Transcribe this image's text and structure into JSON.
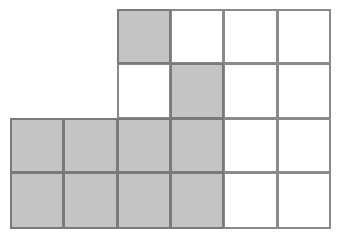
{
  "diagram": {
    "type": "grid-shading",
    "columns": 6,
    "rows": 4,
    "col_lines": [
      10,
      63,
      117,
      170,
      223,
      277,
      330
    ],
    "row_lines": [
      9,
      63,
      118,
      172,
      228
    ],
    "colors": {
      "shaded": "#c4c4c4",
      "unshaded": "#ffffff",
      "line": "#8a8a8a"
    },
    "cells": [
      [
        null,
        null,
        "gray",
        "white",
        "white",
        "white"
      ],
      [
        null,
        null,
        "white",
        "gray",
        "white",
        "white"
      ],
      [
        "gray",
        "gray",
        "gray",
        "gray",
        "white",
        "white"
      ],
      [
        "gray",
        "gray",
        "gray",
        "gray",
        "white",
        "white"
      ]
    ],
    "shaded_count": 10,
    "total_cells": 20
  }
}
